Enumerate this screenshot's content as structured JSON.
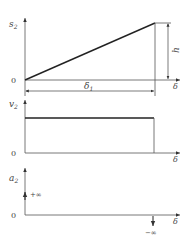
{
  "diagram": {
    "type": "cam-motion-curves",
    "colors": {
      "line": "#333333",
      "thin": "#555555",
      "text": "#444444",
      "background": "#ffffff"
    },
    "panels": [
      {
        "id": "displacement",
        "y_label": "s",
        "y_label_sub": "2",
        "x_label": "δ",
        "origin_label": "0",
        "curve": "linear rise",
        "height_label": "h",
        "span_label": "δ",
        "span_label_sub": "1"
      },
      {
        "id": "velocity",
        "y_label": "v",
        "y_label_sub": "2",
        "x_label": "δ",
        "origin_label": "0",
        "curve": "constant"
      },
      {
        "id": "acceleration",
        "y_label": "a",
        "y_label_sub": "2",
        "x_label": "δ",
        "origin_label": "0",
        "start_impulse_label": "+∞",
        "end_impulse_label": "−∞"
      }
    ]
  }
}
